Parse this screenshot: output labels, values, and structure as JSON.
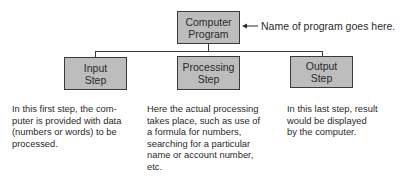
{
  "diagram": {
    "root": {
      "label_lines": [
        "Computer",
        "Program"
      ],
      "annotation": "Name of program goes here."
    },
    "steps": [
      {
        "label_lines": [
          "Input",
          "Step"
        ],
        "description_lines": [
          "In this first step, the com-",
          "puter is provided with data",
          "(numbers or words) to be",
          "processed."
        ]
      },
      {
        "label_lines": [
          "Processing",
          "Step"
        ],
        "description_lines": [
          "Here the actual processing",
          "takes place, such as use of",
          "a formula for numbers,",
          "searching for a particular",
          "name or account number,",
          "etc."
        ]
      },
      {
        "label_lines": [
          "Output",
          "Step"
        ],
        "description_lines": [
          "In this last step, result",
          "would be displayed",
          "by the computer."
        ]
      }
    ],
    "colors": {
      "box_fill": "#bdbdbd",
      "box_border": "#3a3a3a",
      "text": "#2a2a2a"
    }
  }
}
